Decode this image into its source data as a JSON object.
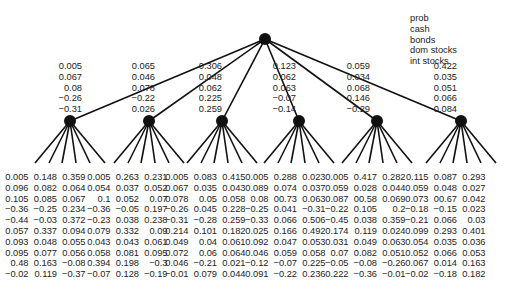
{
  "legend": [
    "prob",
    "cash",
    "bonds",
    "dom stocks",
    "int stocks"
  ],
  "level1": [
    {
      "prob": "0.005",
      "cash": "0.067",
      "bonds": "0.08",
      "dom": "−0.26",
      "int": "−0.31"
    },
    {
      "prob": "0.065",
      "cash": "0.046",
      "bonds": "0.078",
      "dom": "−0.22",
      "int": "0.026"
    },
    {
      "prob": "0.306",
      "cash": "0.048",
      "bonds": "0.062",
      "dom": "0.225",
      "int": "0.259"
    },
    {
      "prob": "0.123",
      "cash": "0.062",
      "bonds": "0.063",
      "dom": "−0.07",
      "int": "−0.14"
    },
    {
      "prob": "0.059",
      "cash": "0.034",
      "bonds": "0.068",
      "dom": "0.146",
      "int": "−0.29"
    },
    {
      "prob": "0.422",
      "cash": "0.035",
      "bonds": "0.051",
      "dom": "0.066",
      "int": "0.084"
    }
  ],
  "leaves": [
    {
      "top": [
        [
          "0.005",
          "0.148",
          "0.359"
        ],
        [
          "0.096",
          "0.082",
          "0.064"
        ],
        [
          "0.105",
          "0.085",
          "0.067"
        ],
        [
          "−0.36",
          "−0.25",
          "0.234"
        ],
        [
          "−0.44",
          "−0.03",
          "0.372"
        ]
      ],
      "bottom": [
        [
          "0.057",
          "0.337",
          "0.094"
        ],
        [
          "0.093",
          "0.048",
          "0.055"
        ],
        [
          "0.095",
          "0.077",
          "0.056"
        ],
        [
          "0.48",
          "0.163",
          "−0.08"
        ],
        [
          "−0.02",
          "0.119",
          "−0.37"
        ]
      ]
    },
    {
      "top": [
        [
          "0.005",
          "0.263",
          "0.231"
        ],
        [
          "0.054",
          "0.037",
          "0.052"
        ],
        [
          "0.1",
          "0.052",
          "0.07"
        ],
        [
          "−0.36",
          "−0.05",
          "0.197"
        ],
        [
          "−0.23",
          "0.038",
          "0.238"
        ]
      ],
      "bottom": [
        [
          "0.079",
          "0.332",
          "0.09"
        ],
        [
          "0.043",
          "0.043",
          "0.061"
        ],
        [
          "0.058",
          "0.081",
          "0.095"
        ],
        [
          "0.394",
          "0.198",
          "−0.3"
        ],
        [
          "−0.07",
          "0.128",
          "−0.19"
        ]
      ]
    },
    {
      "top": [
        [
          "0.005",
          "0.083",
          "0.415"
        ],
        [
          "0.067",
          "0.035",
          "0.043"
        ],
        [
          "0.078",
          "0.05",
          "0.058"
        ],
        [
          "−0.26",
          "0.045",
          "0.228"
        ],
        [
          "−0.31",
          "−0.28",
          "0.259"
        ]
      ],
      "bottom": [
        [
          "0.214",
          "0.101",
          "0.182"
        ],
        [
          "0.049",
          "0.04",
          "0.061"
        ],
        [
          "0.072",
          "0.06",
          "0.064"
        ],
        [
          "0.046",
          "−0.21",
          "0.021"
        ],
        [
          "−0.01",
          "0.079",
          "0.044"
        ]
      ]
    },
    {
      "top": [
        [
          "0.005",
          "0.288",
          "0.023"
        ],
        [
          "0.089",
          "0.074",
          "0.037"
        ],
        [
          "0.08",
          "00.73",
          "0.063"
        ],
        [
          "−0.25",
          "0.041",
          "−0.31"
        ],
        [
          "−0.33",
          "0.066",
          "0.506"
        ]
      ],
      "bottom": [
        [
          "0.025",
          "0.166",
          "0.492"
        ],
        [
          "0.092",
          "0.047",
          "0.053"
        ],
        [
          "0.046",
          "0.059",
          "0.058"
        ],
        [
          "−0.12",
          "−0.07",
          "0.225"
        ],
        [
          "0.091",
          "−0.22",
          "0.236"
        ]
      ]
    },
    {
      "top": [
        [
          "0.005",
          "0.417",
          "0.282"
        ],
        [
          "0.059",
          "0.028",
          "0.044"
        ],
        [
          "0.087",
          "00.58",
          "0.069"
        ],
        [
          "−0.22",
          "0.105",
          "0.2"
        ],
        [
          "−0.45",
          "0.038",
          "0.359"
        ]
      ],
      "bottom": [
        [
          "0.174",
          "0.119",
          "0.024"
        ],
        [
          "0.031",
          "0.049",
          "0.063"
        ],
        [
          "0.07",
          "0.082",
          "0.051"
        ],
        [
          "−0.05",
          "−0.08",
          "−0.26"
        ],
        [
          "0.222",
          "−0.36",
          "−0.01"
        ]
      ]
    },
    {
      "top": [
        [
          "0.115",
          "0.087",
          "0.293"
        ],
        [
          "0.059",
          "0.048",
          "0.027"
        ],
        [
          "0.073",
          "00.67",
          "0.042"
        ],
        [
          "−0.18",
          "−0.15",
          "0.023"
        ],
        [
          "−0.21",
          "0.066",
          "0.03"
        ]
      ],
      "bottom": [
        [
          "0.099",
          "0.293",
          "0.401"
        ],
        [
          "0.054",
          "0.035",
          "0.036"
        ],
        [
          "0.052",
          "0.066",
          "0.053"
        ],
        [
          "0.067",
          "0.014",
          "0.163"
        ],
        [
          "−0.02",
          "−0.18",
          "0.182"
        ]
      ]
    }
  ]
}
